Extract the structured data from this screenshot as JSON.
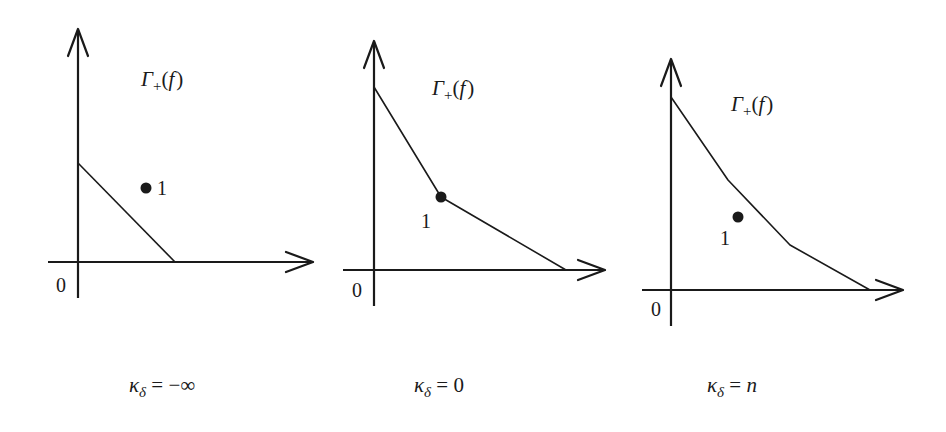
{
  "figure": {
    "panels": [
      {
        "id": "panel-1",
        "region_label": {
          "main": "Γ",
          "sub": "+",
          "arg": "(",
          "f": "f",
          "close": ")"
        },
        "origin_label": "0",
        "point_label": "1",
        "caption": {
          "kappa": "κ",
          "sub": "δ",
          "rel": " = ",
          "value": "−∞"
        },
        "axes": {
          "origin": [
            78,
            262
          ],
          "y_top": 28,
          "y_bottom": 298,
          "x_left": 48,
          "x_right": 313
        },
        "newton_polygon": [
          [
            78,
            163
          ],
          [
            175,
            262
          ]
        ],
        "point": [
          146,
          188
        ]
      },
      {
        "id": "panel-2",
        "region_label": {
          "main": "Γ",
          "sub": "+",
          "arg": "(",
          "f": "f",
          "close": ")"
        },
        "origin_label": "0",
        "point_label": "1",
        "caption": {
          "kappa": "κ",
          "sub": "δ",
          "rel": " = ",
          "value": "0"
        },
        "axes": {
          "origin": [
            374,
            270
          ],
          "y_top": 40,
          "y_bottom": 306,
          "x_left": 343,
          "x_right": 605
        },
        "newton_polygon": [
          [
            374,
            87
          ],
          [
            441,
            197
          ],
          [
            566,
            270
          ]
        ],
        "point": [
          441,
          197
        ]
      },
      {
        "id": "panel-3",
        "region_label": {
          "main": "Γ",
          "sub": "+",
          "arg": "(",
          "f": "f",
          "close": ")"
        },
        "origin_label": "0",
        "point_label": "1",
        "caption": {
          "kappa": "κ",
          "sub": "δ",
          "rel": " = ",
          "value": "n"
        },
        "axes": {
          "origin": [
            671,
            290
          ],
          "y_top": 58,
          "y_bottom": 326,
          "x_left": 642,
          "x_right": 903
        },
        "newton_polygon": [
          [
            671,
            97
          ],
          [
            728,
            180
          ],
          [
            790,
            245
          ],
          [
            870,
            290
          ]
        ],
        "point": [
          738,
          217
        ]
      }
    ]
  },
  "colors": {
    "ink": "#1a1a1a",
    "background": "#ffffff"
  }
}
